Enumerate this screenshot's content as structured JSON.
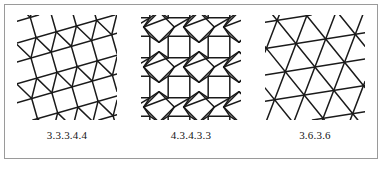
{
  "figure": {
    "border_color": "#9a9a9a",
    "background": "#ffffff",
    "line_color": "#1a1a1a",
    "panels": [
      {
        "label": "3.3.3.4.4",
        "name": "elongated-triangular-tiling",
        "tiling_type": "elongated-triangular",
        "rotation_deg": -16,
        "cell_size": 21,
        "stroke_width": 1.5
      },
      {
        "label": "4.3.4.3.3",
        "name": "snub-square-tiling",
        "tiling_type": "snub-square",
        "rotation_deg": 0,
        "cell_size": 40,
        "stroke_width": 1.5
      },
      {
        "label": "3.6.3.6",
        "name": "trihexagonal-tiling",
        "tiling_type": "trihexagonal",
        "rotation_deg": -9,
        "cell_size": 30,
        "stroke_width": 1.5
      }
    ]
  }
}
